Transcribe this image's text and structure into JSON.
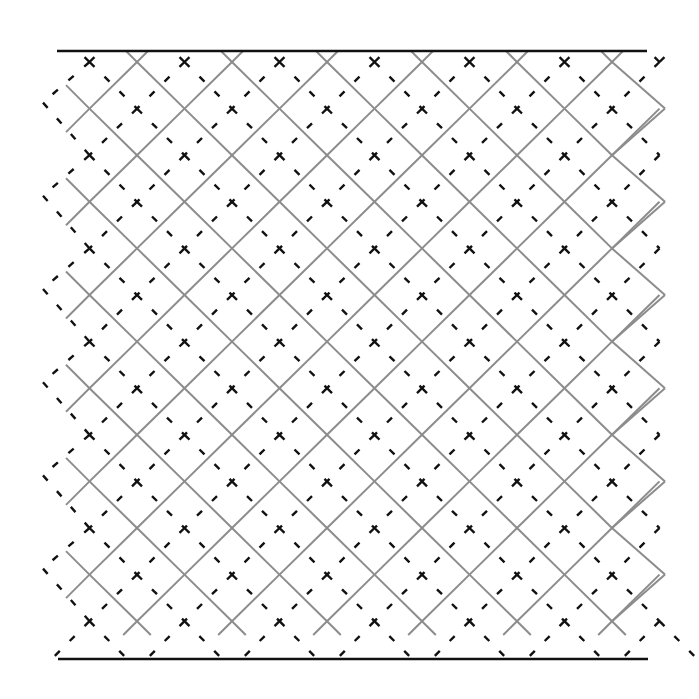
{
  "figure": {
    "width": 699,
    "height": 699,
    "background": "#ffffff",
    "borders": {
      "color": "#111111",
      "stroke_width": 2.6,
      "top": {
        "x1": 57,
        "x2": 647,
        "y": 51
      },
      "bottom": {
        "x1": 58,
        "x2": 648,
        "y": 659
      }
    },
    "solid_lattice": {
      "description": "grey solid diagonal lattice (45 degree lines)",
      "color": "#8c8c8c",
      "stroke_width": 2.0,
      "cell_half_width": 47.5,
      "cell_half_height": 46.6,
      "origin_x": 89.5,
      "origin_y": 62,
      "columns": 12,
      "rows": 13,
      "left_edge_x": 66,
      "right_edge_x": 665,
      "top_y": 51,
      "bottom_y": 635
    },
    "dashed_lattice": {
      "description": "black dashed diagonal lattice offset by half a cell",
      "color": "#111111",
      "stroke_width": 2.4,
      "dash": [
        7,
        14
      ],
      "origin_x": 89.5,
      "origin_y": 62,
      "left_vertex_x": 43,
      "right_x": 640,
      "top_y": 60,
      "bottom_y": 658
    }
  }
}
